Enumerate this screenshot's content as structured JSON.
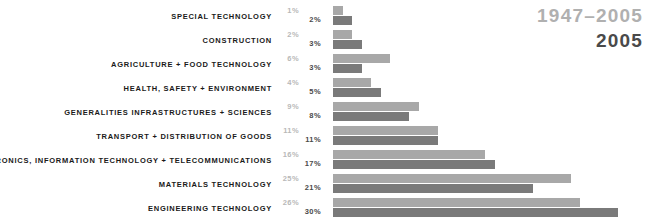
{
  "chart_data": {
    "type": "bar",
    "orientation": "horizontal",
    "title": "",
    "xlabel": "",
    "ylabel": "",
    "grid": false,
    "legend_position": "top-right",
    "value_unit": "%",
    "categories": [
      "SPECIAL TECHNOLOGY",
      "CONSTRUCTION",
      "AGRICULTURE + FOOD TECHNOLOGY",
      "HEALTH, SAFETY + ENVIRONMENT",
      "GENERALITIES INFRASTRUCTURES + SCIENCES",
      "TRANSPORT + DISTRIBUTION OF GOODS",
      "ELECTRONICS, INFORMATION TECHNOLOGY + TELECOMMUNICATIONS",
      "MATERIALS TECHNOLOGY",
      "ENGINEERING TECHNOLOGY"
    ],
    "series": [
      {
        "name": "1947-2005",
        "label": "1947–2005",
        "color": "#a8a8a8",
        "values": [
          1,
          2,
          6,
          4,
          9,
          11,
          16,
          25,
          26
        ],
        "value_labels": [
          "1%",
          "2%",
          "6%",
          "4%",
          "9%",
          "11%",
          "16%",
          "25%",
          "26%"
        ]
      },
      {
        "name": "2005",
        "label": "2005",
        "color": "#7a7a7a",
        "values": [
          2,
          3,
          3,
          5,
          8,
          11,
          17,
          21,
          30
        ],
        "value_labels": [
          "2%",
          "3%",
          "3%",
          "5%",
          "8%",
          "11%",
          "17%",
          "21%",
          "30%"
        ]
      }
    ],
    "xlim": [
      0,
      30
    ],
    "px_per_percent": 9.5
  },
  "legend": {
    "previous_period": "1947–2005",
    "current_period": "2005"
  },
  "rows": [
    {
      "label": "SPECIAL TECHNOLOGY",
      "prev": "1%",
      "curr": "2%",
      "prev_v": 1,
      "curr_v": 2
    },
    {
      "label": "CONSTRUCTION",
      "prev": "2%",
      "curr": "3%",
      "prev_v": 2,
      "curr_v": 3
    },
    {
      "label": "AGRICULTURE + FOOD TECHNOLOGY",
      "prev": "6%",
      "curr": "3%",
      "prev_v": 6,
      "curr_v": 3
    },
    {
      "label": "HEALTH, SAFETY + ENVIRONMENT",
      "prev": "4%",
      "curr": "5%",
      "prev_v": 4,
      "curr_v": 5
    },
    {
      "label": "GENERALITIES INFRASTRUCTURES + SCIENCES",
      "prev": "9%",
      "curr": "8%",
      "prev_v": 9,
      "curr_v": 8
    },
    {
      "label": "TRANSPORT + DISTRIBUTION OF GOODS",
      "prev": "11%",
      "curr": "11%",
      "prev_v": 11,
      "curr_v": 11
    },
    {
      "label": "ELECTRONICS, INFORMATION TECHNOLOGY + TELECOMMUNICATIONS",
      "prev": "16%",
      "curr": "17%",
      "prev_v": 16,
      "curr_v": 17
    },
    {
      "label": "MATERIALS TECHNOLOGY",
      "prev": "25%",
      "curr": "21%",
      "prev_v": 25,
      "curr_v": 21
    },
    {
      "label": "ENGINEERING TECHNOLOGY",
      "prev": "26%",
      "curr": "30%",
      "prev_v": 26,
      "curr_v": 30
    }
  ],
  "colors": {
    "series_previous": "#a8a8a8",
    "series_current": "#7a7a7a",
    "label_text": "#1a1a1a",
    "value_previous_text": "#b8b8b8",
    "value_current_text": "#4a4a4a",
    "legend_previous_text": "#b0b0b0",
    "legend_current_text": "#4a4a4a",
    "background": "#ffffff"
  }
}
